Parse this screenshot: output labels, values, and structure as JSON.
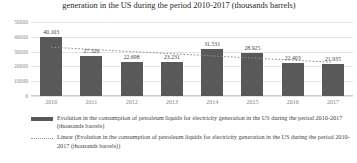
{
  "chart_data": {
    "type": "bar",
    "title": "generation in the US during the period 2010-2017 (thousands barrels)",
    "xlabel": "",
    "ylabel": "",
    "ylim": [
      0,
      50000
    ],
    "yticks": [
      "50000",
      "40000",
      "30000",
      "20000",
      "10000",
      "0"
    ],
    "grid": true,
    "legend_position": "bottom-left",
    "categories": [
      "2010",
      "2011",
      "2012",
      "2013",
      "2014",
      "2015",
      "2016",
      "2017"
    ],
    "values": [
      40103,
      27326,
      22698,
      23231,
      31531,
      28925,
      22403,
      21935
    ],
    "value_labels": [
      "40.103",
      "27.326",
      "22.698",
      "23.231",
      "31.531",
      "28.925",
      "22.403",
      "21.935"
    ],
    "series": [
      {
        "name": "Evolution in the consumption of petroleum liquids for electricity generation in the US during the period 2010-2017 (thousands barrels)",
        "type": "bar",
        "color": "#595959",
        "values": [
          40103,
          27326,
          22698,
          23231,
          31531,
          28925,
          22403,
          21935
        ]
      },
      {
        "name": "Linear (Evolution in the consumption of petroleum liquids for electricity generation in the US during the period 2010-2017 (thousands barrels))",
        "type": "line",
        "style": "dotted",
        "color": "#8c8c8c",
        "values": [
          33000,
          31500,
          30000,
          28600,
          27100,
          25700,
          24200,
          22800
        ]
      }
    ]
  },
  "legend": {
    "items": [
      {
        "key": "bar-swatch",
        "label": "Evolution in the consumption of petroleum liquids for electricity generation in the US during the period 2010-2017 (thousands barrels)"
      },
      {
        "key": "dotted-line-swatch",
        "label": "Linear (Evolution in the consumption of petroleum liquids for electricity generation in the US during the period 2010-2017 (thousands barrels))"
      }
    ]
  },
  "colors": {
    "bar": "#595959",
    "trendline": "#8c8c8c",
    "gridline": "#e4e4e4",
    "tick_text": "#8c8c8c",
    "title_text": "#262626"
  }
}
